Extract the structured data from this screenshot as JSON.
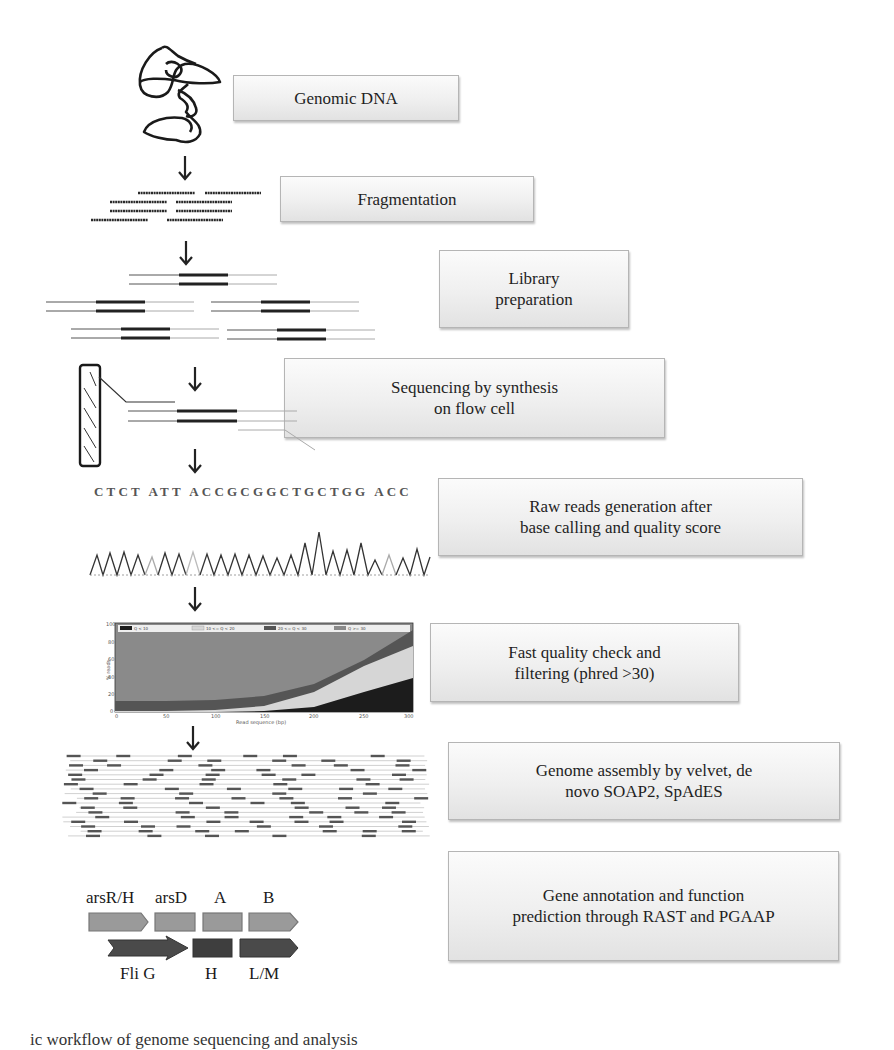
{
  "workflow": {
    "steps": [
      {
        "id": "genomic-dna",
        "lines": [
          "Genomic DNA"
        ]
      },
      {
        "id": "fragmentation",
        "lines": [
          "Fragmentation"
        ]
      },
      {
        "id": "library-preparation",
        "lines": [
          "Library",
          "preparation"
        ]
      },
      {
        "id": "sequencing",
        "lines": [
          "Sequencing by synthesis",
          "on flow cell"
        ]
      },
      {
        "id": "raw-reads",
        "lines": [
          "Raw reads generation after",
          "base calling and quality score"
        ]
      },
      {
        "id": "quality-check",
        "lines": [
          "Fast quality check and",
          "filtering (phred >30)"
        ]
      },
      {
        "id": "genome-assembly",
        "lines": [
          "Genome assembly by velvet, de",
          "novo SOAP2, SpAdES"
        ]
      },
      {
        "id": "gene-annotation",
        "lines": [
          "Gene annotation and function",
          "prediction through RAST and PGAAP"
        ]
      }
    ]
  },
  "illustrations": {
    "base_call_sequence": "CTCT ATT ACCGCGGCTGCTGG ACC",
    "genes": {
      "top_row": [
        "arsR/H",
        "arsD",
        "A",
        "B"
      ],
      "bottom_row": [
        "Fli G",
        "H",
        "L/M"
      ]
    },
    "colors": {
      "box_border": "#b5b5b5",
      "box_fill_top": "#fbfbfb",
      "box_fill_bottom": "#e2e2e2",
      "q_lt_10": "#1c1c1c",
      "q_10_20": "#d6d6d6",
      "q_20_30": "#555555",
      "q_ge_30": "#8a8a8a",
      "gene_light": "#9a9a9a",
      "gene_dark": "#4a4a4a"
    }
  },
  "chart_data": {
    "type": "area",
    "title": "",
    "xlabel": "Read sequence (bp)",
    "ylabel": "% reads",
    "xlim": [
      0,
      300
    ],
    "ylim": [
      0,
      100
    ],
    "x_ticks": [
      "0",
      "50",
      "100",
      "150",
      "200",
      "250",
      "300"
    ],
    "y_ticks": [
      "0",
      "20",
      "40",
      "60",
      "80",
      "100"
    ],
    "legend": [
      "Q < 10",
      "10 <= Q < 20",
      "20 <= Q < 30",
      "Q >= 30"
    ],
    "legend_position": "top",
    "x": [
      0,
      50,
      100,
      150,
      200,
      250,
      300
    ],
    "series": [
      {
        "name": "Q < 10",
        "values": [
          0,
          0,
          0,
          1,
          5,
          22,
          38
        ]
      },
      {
        "name": "10 <= Q < 20",
        "values": [
          1,
          1,
          2,
          6,
          18,
          34,
          37
        ]
      },
      {
        "name": "20 <= Q < 30",
        "values": [
          9,
          9,
          10,
          13,
          22,
          20,
          17
        ]
      },
      {
        "name": "Q >= 30",
        "values": [
          90,
          90,
          88,
          80,
          55,
          24,
          8
        ]
      }
    ]
  },
  "caption": {
    "text": "   ic workflow of genome sequencing and analysis"
  }
}
